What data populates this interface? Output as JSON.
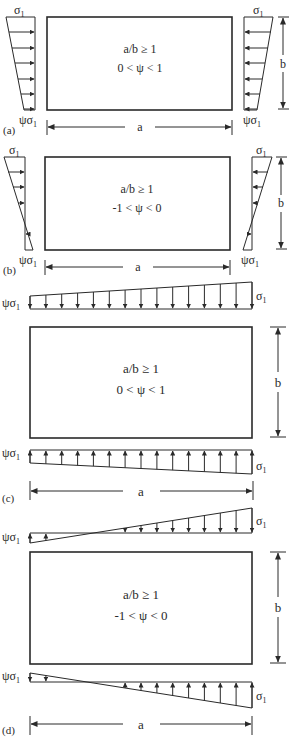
{
  "figure": {
    "panels": [
      {
        "id": "a",
        "label": "(a)",
        "condition_ratio": "a/b ≥ 1",
        "condition_psi": "0 < ψ < 1",
        "load_top_label": "σ1",
        "load_bottom_label": "ψσ1",
        "dim_width": "a",
        "dim_height": "b",
        "load_orientation": "edges-left-right",
        "load_type": "trapezoidal compression"
      },
      {
        "id": "b",
        "label": "(b)",
        "condition_ratio": "a/b ≥ 1",
        "condition_psi": "-1 < ψ < 0",
        "load_top_label": "σ1",
        "load_bottom_label": "ψσ1",
        "dim_width": "a",
        "dim_height": "b",
        "load_orientation": "edges-left-right",
        "load_type": "triangular bending"
      },
      {
        "id": "c",
        "label": "(c)",
        "condition_ratio": "a/b ≥ 1",
        "condition_psi": "0 < ψ < 1",
        "load_left_label": "ψσ1",
        "load_right_label": "σ1",
        "dim_width": "a",
        "dim_height": "b",
        "load_orientation": "edges-top-bottom",
        "load_type": "trapezoidal compression"
      },
      {
        "id": "d",
        "label": "(d)",
        "condition_ratio": "a/b ≥ 1",
        "condition_psi": "-1 < ψ < 0",
        "load_left_label": "ψσ1",
        "load_right_label": "σ1",
        "dim_width": "a",
        "dim_height": "b",
        "load_orientation": "edges-top-bottom",
        "load_type": "triangular bending"
      }
    ],
    "symbols": {
      "sigma": "σ",
      "subscript": "1",
      "psi": "ψ"
    },
    "colors": {
      "line": "#2a2a2a",
      "background": "#ffffff"
    }
  }
}
